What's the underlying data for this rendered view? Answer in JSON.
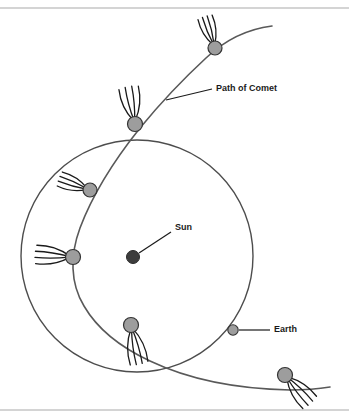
{
  "diagram": {
    "title_clipped_top": "",
    "background_color": "#ffffff",
    "rules": [
      {
        "name": "top-rule",
        "y": 8,
        "color": "#a9a9a9"
      },
      {
        "name": "bottom-rule",
        "y": 410,
        "color": "#a9a9a9"
      }
    ],
    "labels": {
      "path_of_comet": "Path of Comet",
      "sun": "Sun",
      "earth": "Earth"
    },
    "colors": {
      "orbit_stroke": "#4d4d4d",
      "comet_path_stroke": "#595959",
      "comet_body_fill": "#9d9d9d",
      "comet_body_stroke": "#333333",
      "comet_tail_stroke": "#1a1a1a",
      "sun_fill": "#3d3d3d",
      "earth_fill": "#9d9d9d",
      "leader_line": "#1a1a1a",
      "label_text": "#1a1a1a"
    },
    "earth_orbit": {
      "name": "earth-orbit-circle",
      "center_x": 137,
      "center_y": 256,
      "radius": 116,
      "stroke_width": 1.4
    },
    "sun": {
      "name": "sun-marker",
      "x": 133,
      "y": 257,
      "radius": 6.5
    },
    "earth": {
      "name": "earth-marker",
      "x": 233,
      "y": 330,
      "radius": 5.2
    },
    "comet_path": {
      "name": "comet-trajectory",
      "stroke_width": 1.6,
      "path": "M 272 26 C 248 29, 225 40, 206 58 C 180 82, 158 106, 140 128 C 112 163, 92 196, 80 228 C 70 255, 70 283, 84 306 C 98 330, 122 348, 150 361 C 190 380, 240 389, 290 390 C 305 390, 318 389, 330 387"
    },
    "comets": [
      {
        "name": "comet-1",
        "x": 215,
        "y": 48,
        "radius": 7.0,
        "tail_angle": -108,
        "tail_length": 33,
        "tail_spread": 26,
        "tail_count": 4
      },
      {
        "name": "comet-2",
        "x": 135,
        "y": 124,
        "radius": 7.5,
        "tail_angle": -100,
        "tail_length": 38,
        "tail_spread": 30,
        "tail_count": 4
      },
      {
        "name": "comet-3",
        "x": 90,
        "y": 190,
        "radius": 7.0,
        "tail_angle": -160,
        "tail_length": 33,
        "tail_spread": 26,
        "tail_count": 4
      },
      {
        "name": "comet-4",
        "x": 73,
        "y": 257,
        "radius": 7.5,
        "tail_angle": 184,
        "tail_length": 38,
        "tail_spread": 28,
        "tail_count": 4
      },
      {
        "name": "comet-5",
        "x": 131,
        "y": 325,
        "radius": 7.5,
        "tail_angle": 78,
        "tail_length": 40,
        "tail_spread": 26,
        "tail_count": 4
      },
      {
        "name": "comet-6",
        "x": 285,
        "y": 375,
        "radius": 7.5,
        "tail_angle": 48,
        "tail_length": 38,
        "tail_spread": 28,
        "tail_count": 4
      }
    ],
    "leaders": [
      {
        "name": "comet-path-leader",
        "x1": 166,
        "y1": 100,
        "x2": 212,
        "y2": 89,
        "label_x": 216,
        "label_y": 89,
        "anchor": "start",
        "label_key": "path_of_comet"
      },
      {
        "name": "sun-leader",
        "x1": 139,
        "y1": 253,
        "x2": 171,
        "y2": 232,
        "label_x": 175,
        "label_y": 228,
        "anchor": "start",
        "label_key": "sun"
      },
      {
        "name": "earth-leader",
        "x1": 239,
        "y1": 330,
        "x2": 270,
        "y2": 330,
        "label_x": 274,
        "label_y": 330,
        "anchor": "start",
        "label_key": "earth"
      }
    ]
  }
}
